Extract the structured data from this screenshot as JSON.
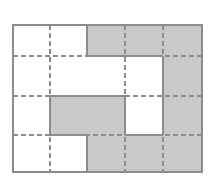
{
  "figure": {
    "name": "shaded-grid-area-model",
    "type": "grid-shading-diagram",
    "columns": 5,
    "rows": 4,
    "geometry": {
      "x_edges": [
        13,
        50,
        87,
        125,
        163,
        202
      ],
      "y_edges": [
        25,
        56,
        96,
        135,
        172
      ],
      "outer_border_width": 1.4,
      "inner_solid_width": 1.4,
      "dashed_width": 1.4,
      "dash_pattern": "5,3"
    },
    "colors": {
      "shaded_fill": "#c9c9c9",
      "unshaded_fill": "#ffffff",
      "border_stroke": "#8c8c8c",
      "dashed_stroke": "#8c8c8c",
      "region_outline": "#8c8c8c",
      "background": "#ffffff"
    },
    "cells": [
      [
        {
          "r": 0,
          "c": 0,
          "shaded": false
        },
        {
          "r": 0,
          "c": 1,
          "shaded": false
        },
        {
          "r": 0,
          "c": 2,
          "shaded": true
        },
        {
          "r": 0,
          "c": 3,
          "shaded": true
        },
        {
          "r": 0,
          "c": 4,
          "shaded": true
        }
      ],
      [
        {
          "r": 1,
          "c": 0,
          "shaded": false
        },
        {
          "r": 1,
          "c": 1,
          "shaded": false
        },
        {
          "r": 1,
          "c": 2,
          "shaded": false
        },
        {
          "r": 1,
          "c": 3,
          "shaded": false
        },
        {
          "r": 1,
          "c": 4,
          "shaded": true
        }
      ],
      [
        {
          "r": 2,
          "c": 0,
          "shaded": false
        },
        {
          "r": 2,
          "c": 1,
          "shaded": true
        },
        {
          "r": 2,
          "c": 2,
          "shaded": true
        },
        {
          "r": 2,
          "c": 3,
          "shaded": false
        },
        {
          "r": 2,
          "c": 4,
          "shaded": true
        }
      ],
      [
        {
          "r": 3,
          "c": 0,
          "shaded": false
        },
        {
          "r": 3,
          "c": 1,
          "shaded": false
        },
        {
          "r": 3,
          "c": 2,
          "shaded": true
        },
        {
          "r": 3,
          "c": 3,
          "shaded": true
        },
        {
          "r": 3,
          "c": 4,
          "shaded": true
        }
      ]
    ],
    "dashed_vertical_lines_x": [
      50,
      125,
      163
    ],
    "dashed_horizontal_lines_y": [
      56,
      96,
      135
    ],
    "shaded_count": 10,
    "total_count": 20,
    "labels": {
      "title": "",
      "caption": ""
    }
  }
}
